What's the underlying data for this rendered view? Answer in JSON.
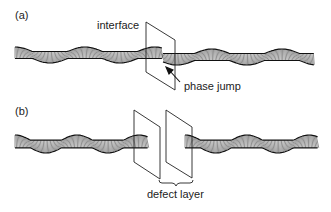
{
  "panels": [
    {
      "id": "a",
      "label": "(a)",
      "annotations": {
        "interface": "interface",
        "phase_jump": "phase jump"
      }
    },
    {
      "id": "b",
      "label": "(b)",
      "annotations": {
        "defect_layer": "defect layer"
      }
    }
  ],
  "colors": {
    "ink": "#1a1a1a",
    "background": "#ffffff"
  },
  "icons": {
    "arrow": "arrow-pointing-to-phase-jump"
  }
}
